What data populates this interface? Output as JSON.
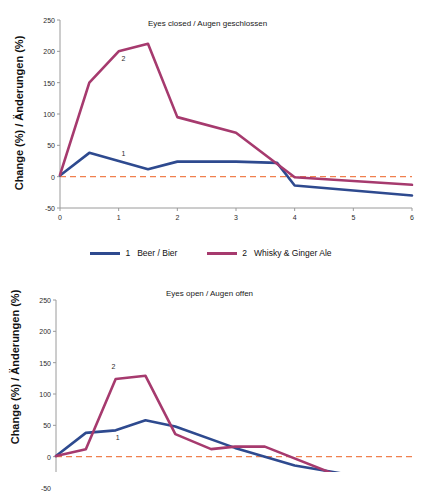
{
  "figure": {
    "background": "#ffffff",
    "axis_label_y": "Change (%) / Änderungen (%)"
  },
  "legend": {
    "position": "between-panels",
    "entries": [
      {
        "key": "1",
        "label": "Beer / Bier",
        "color": "#2e4a8f"
      },
      {
        "key": "2",
        "label": "Whisky & Ginger Ale",
        "color": "#a63a6e"
      }
    ]
  },
  "colors": {
    "series1": "#2e4a8f",
    "series2": "#a63a6e",
    "zero_line": "#f0804f",
    "axis": "#9a9a9a",
    "text": "#1a1a1a"
  },
  "chart_data": [
    {
      "type": "line",
      "title": "Eyes closed / Augen geschlossen",
      "xlabel": "",
      "ylabel": "Change (%) / Änderungen (%)",
      "xlim": [
        0,
        6
      ],
      "ylim": [
        -50,
        250
      ],
      "xticks": [
        0,
        1,
        2,
        3,
        4,
        5,
        6
      ],
      "yticks": [
        -50,
        0,
        50,
        100,
        150,
        200,
        250
      ],
      "xtick_labels": [
        "0",
        "1",
        "2",
        "3",
        "4",
        "5",
        "6"
      ],
      "ytick_labels": [
        "-50",
        "0",
        "50",
        "100",
        "150",
        "200",
        "250"
      ],
      "grid": false,
      "zero_reference_line": {
        "y": 0,
        "style": "dashed",
        "color": "#f0804f"
      },
      "annotations": [
        {
          "text": "2",
          "x": 1.05,
          "y": 188
        },
        {
          "text": "1",
          "x": 1.05,
          "y": 36
        }
      ],
      "series": [
        {
          "name": "1 Beer / Bier",
          "key": "1",
          "color": "#2e4a8f",
          "x": [
            0,
            0.5,
            1,
            1.5,
            2,
            3,
            3.7,
            4,
            6
          ],
          "values": [
            2,
            38,
            25,
            12,
            24,
            24,
            22,
            -14,
            -30
          ]
        },
        {
          "name": "2 Whisky & Ginger Ale",
          "key": "2",
          "color": "#a63a6e",
          "x": [
            0,
            0.5,
            1,
            1.5,
            2,
            3,
            4,
            6
          ],
          "values": [
            3,
            150,
            200,
            212,
            95,
            70,
            -1,
            -13
          ]
        }
      ]
    },
    {
      "type": "line",
      "title": "Eyes open / Augen offen",
      "xlabel": "",
      "ylabel": "Change (%) / Änderungen (%)",
      "xlim": [
        0,
        6
      ],
      "ylim": [
        -50,
        250
      ],
      "xticks": [
        0,
        1,
        2,
        3,
        4,
        5,
        6
      ],
      "yticks": [
        -50,
        0,
        50,
        100,
        150,
        200,
        250
      ],
      "xtick_labels": [
        "0",
        "1",
        "2",
        "3",
        "4",
        "5",
        "6"
      ],
      "ytick_labels": [
        "-50",
        "0",
        "50",
        "100",
        "150",
        "200",
        "250"
      ],
      "grid": false,
      "zero_reference_line": {
        "y": 0,
        "style": "dashed",
        "color": "#f0804f"
      },
      "annotations": [
        {
          "text": "2",
          "x": 0.93,
          "y": 143
        },
        {
          "text": "1",
          "x": 1.0,
          "y": 30
        }
      ],
      "series": [
        {
          "name": "1 Beer / Bier",
          "key": "1",
          "color": "#2e4a8f",
          "x": [
            0,
            0.5,
            1,
            1.5,
            2,
            3,
            4,
            4.8,
            6
          ],
          "values": [
            1,
            38,
            42,
            58,
            48,
            14,
            -14,
            -27,
            -28
          ]
        },
        {
          "name": "2 Whisky & Ginger Ale",
          "key": "2",
          "color": "#a63a6e",
          "x": [
            0,
            0.5,
            1,
            1.5,
            2,
            2.6,
            3,
            3.5,
            4.8,
            6
          ],
          "values": [
            1,
            12,
            124,
            129,
            36,
            12,
            16,
            16,
            -33,
            -28
          ]
        }
      ]
    }
  ]
}
